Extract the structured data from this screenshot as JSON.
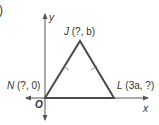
{
  "figure": {
    "part_marker": ")",
    "axes": {
      "x_label": "x",
      "y_label": "y",
      "origin_label": "O"
    },
    "points": {
      "J": {
        "name": "J",
        "coords": "(?, b)"
      },
      "N": {
        "name": "N",
        "coords": "(?, 0)"
      },
      "L": {
        "name": "L",
        "coords": "(3a, ?)"
      }
    },
    "shape": "isosceles triangle",
    "congruent_sides": [
      "NJ",
      "JL"
    ],
    "colors": {
      "triangle": "#4a4a4a",
      "axes": "#555555",
      "text": "#333333"
    }
  }
}
